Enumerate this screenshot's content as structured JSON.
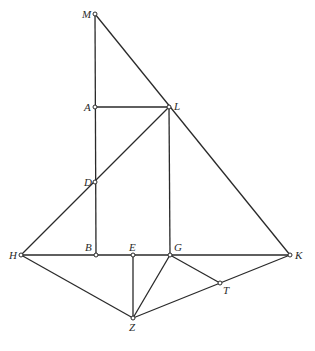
{
  "diagram": {
    "points": {
      "M": {
        "label": "M",
        "x": 95,
        "y": 14
      },
      "A": {
        "label": "A",
        "x": 95,
        "y": 107
      },
      "L": {
        "label": "L",
        "x": 169,
        "y": 107
      },
      "D": {
        "label": "D",
        "x": 95,
        "y": 182
      },
      "H": {
        "label": "H",
        "x": 21,
        "y": 255
      },
      "B": {
        "label": "B",
        "x": 96,
        "y": 255
      },
      "E": {
        "label": "E",
        "x": 133,
        "y": 255
      },
      "G": {
        "label": "G",
        "x": 170,
        "y": 255
      },
      "K": {
        "label": "K",
        "x": 290,
        "y": 255
      },
      "T": {
        "label": "T",
        "x": 220,
        "y": 283
      },
      "Z": {
        "label": "Z",
        "x": 133,
        "y": 318
      }
    },
    "segments": [
      "MB",
      "ML",
      "LK",
      "AL",
      "LH",
      "LG",
      "HK",
      "HZ",
      "EZ",
      "GZ",
      "GT",
      "ZK"
    ]
  }
}
